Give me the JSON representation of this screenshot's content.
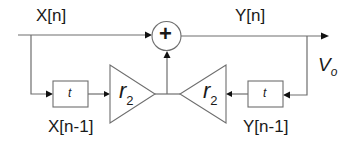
{
  "diagram": {
    "type": "block-diagram",
    "title": "",
    "signals": {
      "input": "X[n]",
      "output": "Y[n]",
      "input_delayed": "X[n-1]",
      "output_delayed": "Y[n-1]",
      "output_voltage_main": "V",
      "output_voltage_sub": "o"
    },
    "summing_junction": {
      "symbol": "+"
    },
    "delay_blocks": [
      {
        "id": "left-delay",
        "label": "t"
      },
      {
        "id": "right-delay",
        "label": "t"
      }
    ],
    "gain_blocks": [
      {
        "id": "left-gain",
        "main": "r",
        "sub": "2",
        "direction": "right"
      },
      {
        "id": "right-gain",
        "main": "r",
        "sub": "2",
        "direction": "left"
      }
    ],
    "colors": {
      "line": "#6e6e6e",
      "arrow": "#111111",
      "text": "#1a1a1a",
      "background": "#ffffff"
    }
  }
}
